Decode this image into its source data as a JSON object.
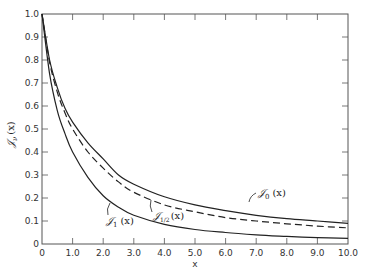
{
  "chart_data": {
    "type": "line",
    "title": "",
    "xlabel": "x",
    "ylabel": "𝒥ν (x)",
    "xlim": [
      0,
      10
    ],
    "ylim": [
      0,
      1.0
    ],
    "grid": false,
    "legend": "inline labels",
    "x_ticks": [
      "0",
      "1.0",
      "2.0",
      "3.0",
      "4.0",
      "5.0",
      "6.0",
      "7.0",
      "8.0",
      "9.0",
      "10.0"
    ],
    "y_ticks": [
      "0",
      "0.1",
      "0.2",
      "0.3",
      "0.4",
      "0.5",
      "0.6",
      "0.7",
      "0.8",
      "0.9",
      "1.0"
    ],
    "x": [
      0,
      0.25,
      0.5,
      0.75,
      1.0,
      1.5,
      2.0,
      2.5,
      3.0,
      4.0,
      5.0,
      6.0,
      7.0,
      8.0,
      9.0,
      10.0
    ],
    "series": [
      {
        "name": "𝒥0 (x)",
        "style": "solid",
        "values": [
          1.0,
          0.8,
          0.68,
          0.59,
          0.53,
          0.44,
          0.37,
          0.3,
          0.26,
          0.205,
          0.17,
          0.145,
          0.125,
          0.11,
          0.1,
          0.09
        ]
      },
      {
        "name": "𝒥1/2 (x)",
        "style": "dashed",
        "values": [
          1.0,
          0.79,
          0.66,
          0.57,
          0.5,
          0.4,
          0.33,
          0.27,
          0.225,
          0.17,
          0.14,
          0.115,
          0.1,
          0.088,
          0.078,
          0.07
        ]
      },
      {
        "name": "𝒥1 (x)",
        "style": "solid",
        "values": [
          1.0,
          0.74,
          0.58,
          0.48,
          0.4,
          0.29,
          0.21,
          0.16,
          0.125,
          0.085,
          0.063,
          0.05,
          0.04,
          0.033,
          0.028,
          0.025
        ]
      }
    ]
  },
  "labels": {
    "j0": "𝒥",
    "j0_sub": "0",
    "j0_arg": "(x)",
    "jhalf": "𝒥",
    "jhalf_sub": "1/2",
    "jhalf_arg": "(x)",
    "j1": "𝒥",
    "j1_sub": "1",
    "j1_arg": "(x)",
    "ylabel_main": "𝒥",
    "ylabel_sub": "ν",
    "ylabel_arg": "(x)",
    "xlabel": "x"
  },
  "colors": {
    "axis": "#555555",
    "curve": "#222222",
    "background": "#ffffff"
  }
}
